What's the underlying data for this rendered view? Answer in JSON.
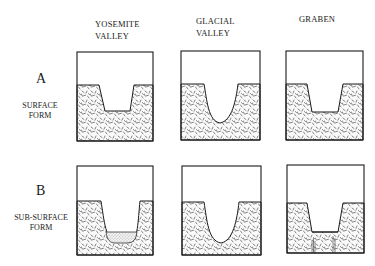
{
  "columns": [
    {
      "line1": "YOSEMITE",
      "line2": "VALLEY"
    },
    {
      "line1": "GLACIAL",
      "line2": "VALLEY"
    },
    {
      "line1": "GRABEN",
      "line2": ""
    }
  ],
  "rows": [
    {
      "letter": "A",
      "line1": "SURFACE",
      "line2": "FORM"
    },
    {
      "letter": "B",
      "line1": "SUB-SURFACE",
      "line2": "FORM"
    }
  ],
  "panels": [
    {
      "row": "A",
      "column": "YOSEMITE VALLEY",
      "shape": "u-flat-bottom"
    },
    {
      "row": "A",
      "column": "GLACIAL VALLEY",
      "shape": "u-round-bottom"
    },
    {
      "row": "A",
      "column": "GRABEN",
      "shape": "trapezoid"
    },
    {
      "row": "B",
      "column": "YOSEMITE VALLEY",
      "shape": "u-with-sediment-fill"
    },
    {
      "row": "B",
      "column": "GLACIAL VALLEY",
      "shape": "u-round-bottom"
    },
    {
      "row": "B",
      "column": "GRABEN",
      "shape": "trapezoid-with-faults"
    }
  ],
  "colors": {
    "ink": "#1a1a1a",
    "background": "#ffffff"
  }
}
